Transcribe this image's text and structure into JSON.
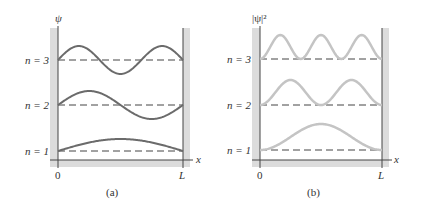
{
  "panels": [
    {
      "id": "a",
      "caption": "(a)",
      "y_label": "ψ",
      "x_label": "x",
      "x_ticks": [
        "0",
        "L"
      ],
      "levels": [
        "n = 3",
        "n = 2",
        "n = 1"
      ],
      "curve_color": "#6b6b6b",
      "description": "Wave functions ψ_n for particle in a box, n = 1, 2, 3"
    },
    {
      "id": "b",
      "caption": "(b)",
      "y_label": "|ψ|²",
      "x_label": "x",
      "x_ticks": [
        "0",
        "L"
      ],
      "levels": [
        "n = 3",
        "n = 2",
        "n = 1"
      ],
      "curve_color": "#bdbdbd",
      "description": "Probability densities |ψ_n|² for particle in a box, n = 1, 2, 3"
    }
  ],
  "colors": {
    "wall_shade": "#dcdcdc",
    "axis": "#444444",
    "dashed": "#444444",
    "text": "#333333"
  }
}
